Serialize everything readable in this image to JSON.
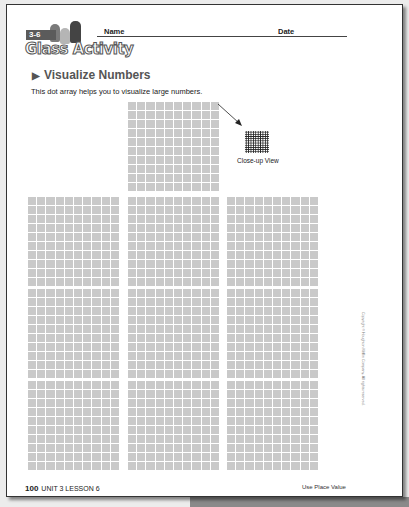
{
  "header": {
    "lesson_badge": "3-6",
    "activity_title": "Glass Activity",
    "name_label": "Name",
    "date_label": "Date"
  },
  "section": {
    "title": "Visualize Numbers",
    "intro": "This dot array helps you to visualize large numbers."
  },
  "dot_array": {
    "top_block_count": 1,
    "grid_rows": 3,
    "grid_cols": 3,
    "cells_per_block": "10 × 10",
    "closeup_label": "Close-up View"
  },
  "copyright": "Copyright © Houghton Mifflin Company. All rights reserved.",
  "footer": {
    "page_number": "100",
    "unit_lesson": "UNIT 3 LESSON 6",
    "topic": "Use Place Value"
  },
  "colors": {
    "cell": "#c9c9c9",
    "text": "#222222",
    "heading": "#555555"
  }
}
